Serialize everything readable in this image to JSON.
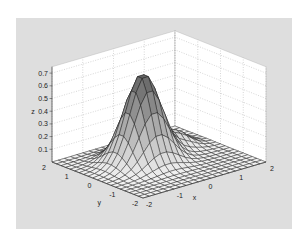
{
  "chart_data": {
    "type": "surface3d",
    "title": "",
    "xlabel": "x",
    "ylabel": "y",
    "zlabel": "z",
    "xlim": [
      -2,
      2
    ],
    "ylim": [
      -2,
      2
    ],
    "zlim": [
      0,
      0.75
    ],
    "x_ticks": [
      "-2",
      "-1",
      "0",
      "1",
      "2"
    ],
    "y_ticks": [
      "-2",
      "-1",
      "0",
      "1",
      "2"
    ],
    "z_ticks": [
      "0.1",
      "0.2",
      "0.3",
      "0.4",
      "0.5",
      "0.6",
      "0.7"
    ],
    "grid": true,
    "grid_resolution": 21,
    "surface_function": "0.7*exp(-((x+0.3)^2 + (y-0.3)^2)/0.5) + 0.12*exp(-((x-1.0)^2 + (y-0.6)^2)/0.25)",
    "components": [
      {
        "amplitude": 0.7,
        "center_x": -0.3,
        "center_y": 0.3,
        "spread": 0.5
      },
      {
        "amplitude": 0.12,
        "center_x": 1.0,
        "center_y": 0.6,
        "spread": 0.25
      }
    ],
    "peak_z": 0.7,
    "colormap": "gray",
    "edge_color": "#1a1a1a",
    "box_color": "#ffffff",
    "background_color": "#dedede"
  }
}
